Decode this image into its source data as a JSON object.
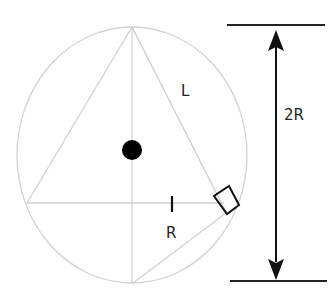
{
  "diagram": {
    "labels": {
      "chord": "L",
      "radius": "R",
      "diameter": "2R"
    },
    "colors": {
      "construction_line": "#cfcfcf",
      "ink": "#111111",
      "background": "#ffffff"
    },
    "elements": {
      "circle": {
        "cx": 132,
        "cy": 155,
        "rx": 115,
        "ry": 128
      },
      "center_dot": {
        "cx": 132,
        "cy": 150,
        "r": 10
      },
      "vertices": {
        "top": [
          132,
          27
        ],
        "bottom": [
          132,
          283
        ],
        "left": [
          27,
          203
        ],
        "right": [
          228,
          212
        ]
      },
      "dimension": {
        "top_line": {
          "x1": 227,
          "x2": 325,
          "y": 25
        },
        "bottom_line": {
          "x1": 230,
          "x2": 327,
          "y": 281
        },
        "arrow_x": 276
      }
    }
  }
}
